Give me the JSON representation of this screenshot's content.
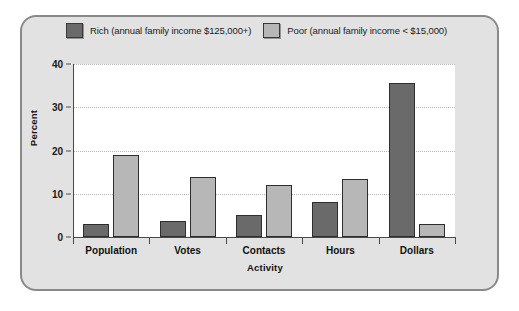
{
  "chart_data": {
    "type": "bar",
    "title": "",
    "xlabel": "Activity",
    "ylabel": "Percent",
    "categories": [
      "Population",
      "Votes",
      "Contacts",
      "Hours",
      "Dollars"
    ],
    "series": [
      {
        "name": "Rich (annual family income $125,000+)",
        "key": "rich",
        "color": "#6a6a6a",
        "values": [
          3,
          3.7,
          5.2,
          8,
          35.7
        ]
      },
      {
        "name": "Poor (annual family income < $15,000)",
        "key": "poor",
        "color": "#b7b7b7",
        "values": [
          18.9,
          13.9,
          12,
          13.4,
          3.1
        ]
      }
    ],
    "ylim": [
      0,
      40
    ],
    "yticks": [
      0,
      10,
      20,
      30,
      40
    ],
    "ytick_labels": [
      "0",
      "10",
      "20",
      "30",
      "40"
    ],
    "grid": true,
    "legend_position": "top"
  },
  "legend": {
    "entries": [
      {
        "label": "Rich (annual family income $125,000+)",
        "swatch": "dark-gray-swatch"
      },
      {
        "label": "Poor (annual family income < $15,000)",
        "swatch": "light-gray-swatch"
      }
    ]
  },
  "colors": {
    "rich_bar": "#6a6a6a",
    "poor_bar": "#b7b7b7",
    "panel_background": "#e2e2e2",
    "panel_border": "#8a8a8a",
    "plot_background": "#ffffff",
    "axis": "#4a4a4a",
    "gridline": "#b9b9b9"
  }
}
